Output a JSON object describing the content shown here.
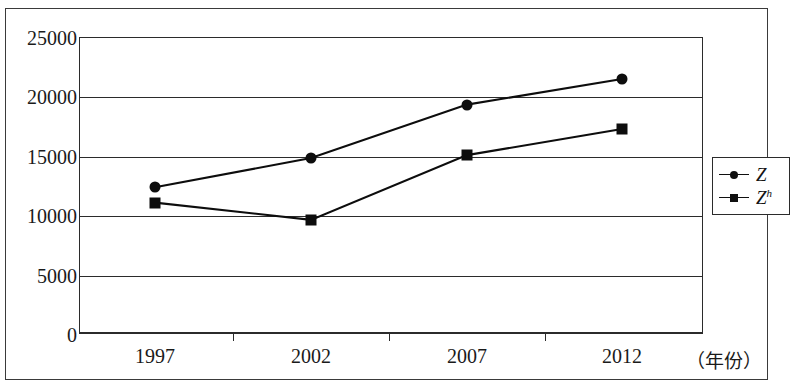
{
  "chart_data": {
    "type": "line",
    "title": "",
    "xlabel": "（年份）",
    "ylabel": "",
    "categories": [
      "1997",
      "2002",
      "2007",
      "2012"
    ],
    "yticks": [
      "0",
      "5000",
      "10000",
      "15000",
      "20000",
      "25000"
    ],
    "ylim": [
      0,
      25000
    ],
    "grid": true,
    "legend_position": "right",
    "series": [
      {
        "name": "Z",
        "name_base": "Z",
        "name_sup": "",
        "marker": "circle",
        "color": "#0d0d0d",
        "values": [
          12400,
          14850,
          19350,
          21500
        ]
      },
      {
        "name": "Zh",
        "name_base": "Z",
        "name_sup": "h",
        "marker": "square",
        "color": "#0d0d0d",
        "values": [
          11100,
          9650,
          15100,
          17300
        ]
      }
    ]
  },
  "axis": {
    "x_title": "（年份）",
    "tick_0": "0",
    "tick_1": "5000",
    "tick_2": "10000",
    "tick_3": "15000",
    "tick_4": "20000",
    "tick_5": "25000",
    "cat_0": "1997",
    "cat_1": "2002",
    "cat_2": "2007",
    "cat_3": "2012"
  },
  "legend": {
    "item_0_base": "Z",
    "item_0_sup": "",
    "item_1_base": "Z",
    "item_1_sup": "h"
  },
  "colors": {
    "ink": "#0d0d0d",
    "axis": "#2b2b2b",
    "frame": "#3a3a3a",
    "background": "#ffffff"
  }
}
